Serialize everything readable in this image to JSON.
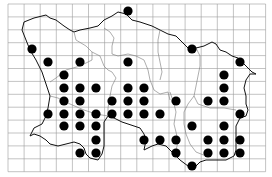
{
  "map": {
    "type": "distribution-map",
    "colors": {
      "grid": "#9a9a9a",
      "coast": "#111111",
      "boundary": "#777777",
      "dot": "#000000",
      "background": "#ffffff"
    },
    "grid": {
      "x0": 8,
      "y0": 4,
      "cols": 16,
      "rows": 13,
      "cell_w": 16.1,
      "cell_h": 12.9
    },
    "dot_radius": 4.6,
    "dots": [
      [
        128,
        11
      ],
      [
        32,
        49
      ],
      [
        192,
        49
      ],
      [
        48,
        62
      ],
      [
        80,
        62
      ],
      [
        128,
        62
      ],
      [
        240,
        62
      ],
      [
        64,
        75
      ],
      [
        224,
        75
      ],
      [
        64,
        88
      ],
      [
        80,
        88
      ],
      [
        96,
        88
      ],
      [
        128,
        88
      ],
      [
        144,
        88
      ],
      [
        224,
        88
      ],
      [
        64,
        101
      ],
      [
        80,
        101
      ],
      [
        112,
        101
      ],
      [
        128,
        101
      ],
      [
        144,
        101
      ],
      [
        176,
        101
      ],
      [
        208,
        101
      ],
      [
        224,
        101
      ],
      [
        48,
        114
      ],
      [
        64,
        114
      ],
      [
        80,
        114
      ],
      [
        96,
        114
      ],
      [
        112,
        114
      ],
      [
        128,
        114
      ],
      [
        144,
        114
      ],
      [
        160,
        114
      ],
      [
        240,
        114
      ],
      [
        64,
        126
      ],
      [
        80,
        126
      ],
      [
        96,
        126
      ],
      [
        192,
        126
      ],
      [
        224,
        126
      ],
      [
        96,
        140
      ],
      [
        144,
        140
      ],
      [
        160,
        140
      ],
      [
        176,
        140
      ],
      [
        208,
        140
      ],
      [
        224,
        140
      ],
      [
        240,
        140
      ],
      [
        80,
        153
      ],
      [
        96,
        153
      ],
      [
        176,
        153
      ],
      [
        208,
        153
      ],
      [
        224,
        153
      ],
      [
        240,
        153
      ],
      [
        192,
        166
      ]
    ]
  }
}
